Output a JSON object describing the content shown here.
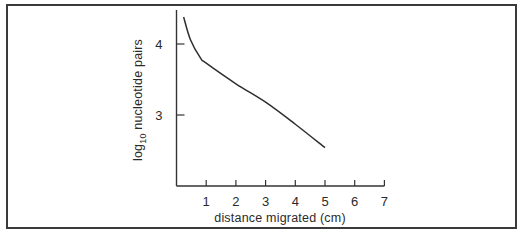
{
  "chart_data": {
    "type": "line",
    "title": "",
    "xlabel": "distance migrated (cm)",
    "ylabel": "log10 nucleotide pairs",
    "ylabel_parts": {
      "base": "log",
      "sub": "10",
      "rest": "nucleotide pairs"
    },
    "xlim": [
      0,
      7
    ],
    "ylim": [
      2.0,
      4.45
    ],
    "x_ticks": [
      1,
      2,
      3,
      4,
      5,
      6,
      7
    ],
    "y_ticks": [
      3,
      4
    ],
    "grid": false,
    "legend": null,
    "series": [
      {
        "name": "DNA fragment size vs migration",
        "x": [
          0.24,
          0.47,
          0.81,
          1.0,
          2.0,
          3.0,
          4.0,
          5.0
        ],
        "y": [
          4.38,
          4.06,
          3.8,
          3.73,
          3.44,
          3.18,
          2.87,
          2.54
        ]
      }
    ]
  }
}
